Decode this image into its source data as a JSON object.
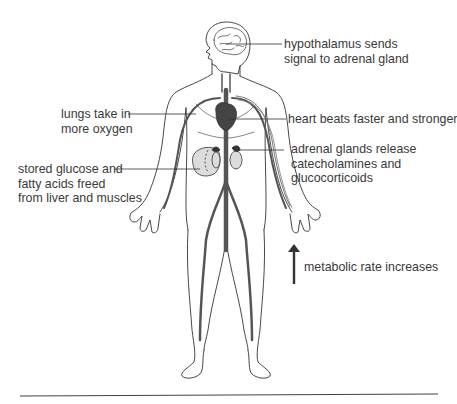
{
  "diagram": {
    "type": "anatomical-illustration",
    "colors": {
      "outline": "#333333",
      "vessel": "#555555",
      "organ_fill": "#dcdcdc",
      "text": "#3a3a3a",
      "rule": "#444444"
    },
    "labels": {
      "hypothalamus": {
        "line1": "hypothalamus sends",
        "line2": "signal to adrenal gland"
      },
      "lungs": {
        "line1": "lungs take in",
        "line2": "more oxygen"
      },
      "heart": {
        "line1": "heart beats faster and stronger"
      },
      "adrenal": {
        "line1": "adrenal glands release",
        "line2": "catecholamines and",
        "line3": "glucocorticoids"
      },
      "glucose": {
        "line1": "stored glucose and",
        "line2": "fatty acids freed",
        "line3": "from liver and muscles"
      },
      "metabolic": {
        "line1": "metabolic rate increases",
        "arrow": "up-arrow"
      }
    }
  }
}
